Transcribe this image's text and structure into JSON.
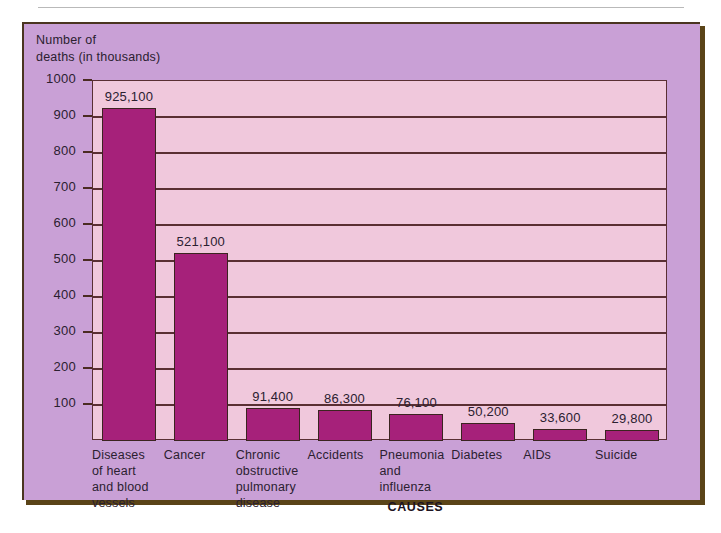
{
  "chart_data": {
    "type": "bar",
    "title": "",
    "xlabel": "CAUSES",
    "ylabel": "Number of\ndeaths (in thousands)",
    "ylim": [
      0,
      1000
    ],
    "ytick_step": 100,
    "grid": true,
    "legend": "none",
    "value_unit": "deaths",
    "categories": [
      "Diseases\nof heart\nand blood\nvessels",
      "Cancer",
      "Chronic\nobstructive\npulmonary\ndisease",
      "Accidents",
      "Pneumonia\nand\ninfluenza",
      "Diabetes",
      "AIDs",
      "Suicide"
    ],
    "values": [
      925100,
      521100,
      91400,
      86300,
      76100,
      50200,
      33600,
      29800
    ],
    "values_thousands": [
      925.1,
      521.1,
      91.4,
      86.3,
      76.1,
      50.2,
      33.6,
      29.8
    ],
    "data_labels": [
      "925,100",
      "521,100",
      "91,400",
      "86,300",
      "76,100",
      "50,200",
      "33,600",
      "29,800"
    ],
    "ytick_labels": [
      "100",
      "200",
      "300",
      "400",
      "500",
      "600",
      "700",
      "800",
      "900",
      "1000"
    ],
    "ytick_values": [
      100,
      200,
      300,
      400,
      500,
      600,
      700,
      800,
      900,
      1000
    ],
    "colors": {
      "bar": "#a6217a",
      "bar_outline": "#3b2420",
      "plot_background": "#f0c8dc",
      "panel_background": "#c9a0d6",
      "gridline": "#5a2f33",
      "text": "#2b2030",
      "panel_border": "#4a3520",
      "panel_shadow": "#5a4418",
      "page_background": "#ffffff",
      "top_rule": "#b9b9b9"
    }
  }
}
